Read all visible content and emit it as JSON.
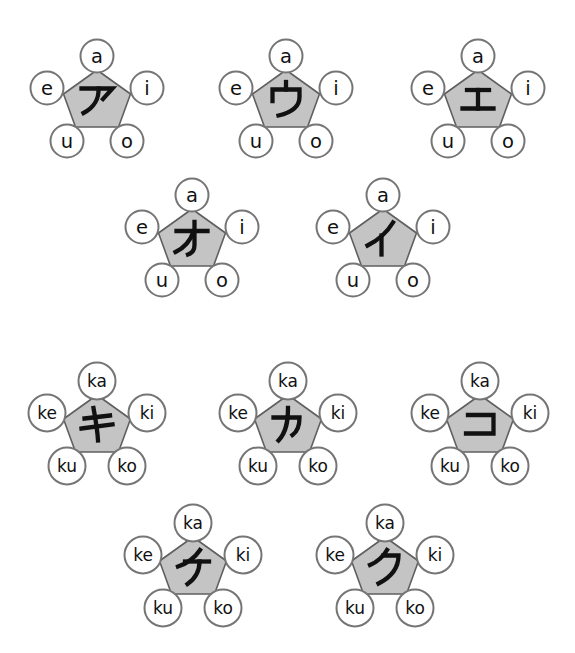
{
  "colors": {
    "background": "#ffffff",
    "pentagon_fill": "#c4c4c4",
    "pentagon_stroke": "#5f5f5f",
    "circle_fill": "#ffffff",
    "circle_stroke": "#757575",
    "ink": "#111111"
  },
  "groups": [
    {
      "name": "vowel-row",
      "romaji_labels": {
        "top": "a",
        "left": "e",
        "right": "i",
        "bottom_left": "u",
        "bottom_right": "o"
      },
      "rows": [
        {
          "units": [
            {
              "kana": "ア",
              "romaji": "a"
            },
            {
              "kana": "ウ",
              "romaji": "u"
            },
            {
              "kana": "エ",
              "romaji": "e"
            }
          ]
        },
        {
          "units": [
            {
              "kana": "オ",
              "romaji": "o"
            },
            {
              "kana": "イ",
              "romaji": "i"
            }
          ]
        }
      ]
    },
    {
      "name": "ka-row",
      "romaji_labels": {
        "top": "ka",
        "left": "ke",
        "right": "ki",
        "bottom_left": "ku",
        "bottom_right": "ko"
      },
      "rows": [
        {
          "units": [
            {
              "kana": "キ",
              "romaji": "ki"
            },
            {
              "kana": "カ",
              "romaji": "ka"
            },
            {
              "kana": "コ",
              "romaji": "ko"
            }
          ]
        },
        {
          "units": [
            {
              "kana": "ケ",
              "romaji": "ke"
            },
            {
              "kana": "ク",
              "romaji": "ku"
            }
          ]
        }
      ]
    }
  ]
}
